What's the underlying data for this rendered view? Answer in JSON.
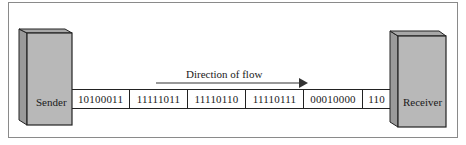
{
  "diagram": {
    "sender": {
      "label": "Sender",
      "color": "#b8b8b8"
    },
    "receiver": {
      "label": "Receiver",
      "color": "#b8b8b8"
    },
    "flow": {
      "label": "Direction of flow",
      "direction": "right"
    },
    "bit_groups": [
      "10100011",
      "11111011",
      "11110110",
      "11110111",
      "00010000",
      "110"
    ]
  }
}
